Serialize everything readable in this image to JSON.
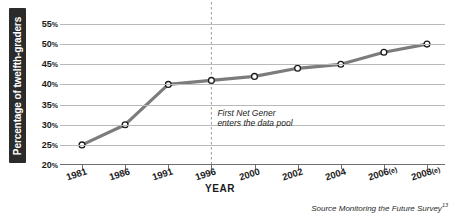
{
  "chart_data": {
    "type": "line",
    "title": "",
    "xlabel": "YEAR",
    "ylabel": "Percentage of twelfth-graders",
    "categories": [
      "1981",
      "1986",
      "1991",
      "1996",
      "2000",
      "2002",
      "2004",
      "2006(e)",
      "2008(e)"
    ],
    "x": [
      1981,
      1986,
      1991,
      1996,
      2000,
      2002,
      2004,
      2006,
      2008
    ],
    "values": [
      25,
      30,
      40,
      41,
      42,
      44,
      45,
      48,
      50
    ],
    "series": [
      {
        "name": "Percentage of twelfth-graders",
        "values": [
          25,
          30,
          40,
          41,
          42,
          44,
          45,
          48,
          50
        ]
      }
    ],
    "ylim": [
      20,
      55
    ],
    "yticks": [
      20,
      25,
      30,
      35,
      40,
      45,
      50,
      55
    ],
    "ytick_labels": [
      "20%",
      "25%",
      "30%",
      "35%",
      "40%",
      "45%",
      "50%",
      "55%"
    ],
    "grid": true,
    "legend": false,
    "line_color": "#7c7c7c",
    "marker_fill": "#ffffff",
    "marker_edge": "#1a1a1a",
    "gridline_color": "#b9b9b9",
    "annotations": [
      {
        "name": "first-net-gener-marker",
        "line1": "First Net Gener",
        "line2": "enters the data pool",
        "at_category": "1996",
        "style": "vertical-dashed-line"
      }
    ]
  },
  "axes": {
    "y_title": "Percentage of twelfth-graders",
    "x_title": "YEAR",
    "y_ticks": [
      {
        "value": 55,
        "number": "55",
        "suffix": "%"
      },
      {
        "value": 50,
        "number": "50",
        "suffix": "%"
      },
      {
        "value": 45,
        "number": "45",
        "suffix": "%"
      },
      {
        "value": 40,
        "number": "40",
        "suffix": "%"
      },
      {
        "value": 35,
        "number": "35",
        "suffix": "%"
      },
      {
        "value": 30,
        "number": "30",
        "suffix": "%"
      },
      {
        "value": 25,
        "number": "25",
        "suffix": "%"
      },
      {
        "value": 20,
        "number": "20",
        "suffix": "%"
      }
    ],
    "x_ticks": [
      {
        "label": "1981",
        "base": "1981",
        "est": ""
      },
      {
        "label": "1986",
        "base": "1986",
        "est": ""
      },
      {
        "label": "1991",
        "base": "1991",
        "est": ""
      },
      {
        "label": "1996",
        "base": "1996",
        "est": ""
      },
      {
        "label": "2000",
        "base": "2000",
        "est": ""
      },
      {
        "label": "2002",
        "base": "2002",
        "est": ""
      },
      {
        "label": "2004",
        "base": "2004",
        "est": ""
      },
      {
        "label": "2006(e)",
        "base": "2006",
        "est": "(e)"
      },
      {
        "label": "2008(e)",
        "base": "2008",
        "est": "(e)"
      }
    ]
  },
  "annotation": {
    "line1": "First Net Gener",
    "line2": "enters the data pool"
  },
  "source": {
    "text": "Source Monitoring the Future Survey",
    "superscript": "13"
  }
}
